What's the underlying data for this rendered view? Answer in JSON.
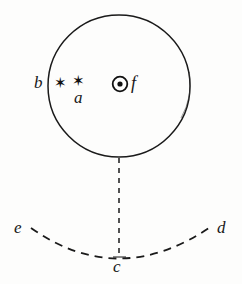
{
  "figure": {
    "background_color": "#fdfdfc",
    "ink_color": "#1a1a1a",
    "circle": {
      "name": "field-circle",
      "center_x": 119,
      "center_y": 86,
      "radius": 71,
      "stroke_width": 1.4,
      "style": "solid"
    },
    "vertical_line": {
      "name": "plumb-line",
      "x": 119,
      "y_start": 157,
      "y_end": 257,
      "style": "dashed"
    },
    "arc": {
      "name": "horizon-arc",
      "style": "dashed",
      "left_x": 30,
      "left_y": 228,
      "bottom_x": 119,
      "bottom_y": 257,
      "right_x": 212,
      "right_y": 226
    },
    "points": [
      {
        "id": "star-1",
        "glyph": "✶",
        "x": 60,
        "y": 84,
        "kind": "star-mark"
      },
      {
        "id": "star-2",
        "glyph": "✶",
        "x": 78,
        "y": 82,
        "kind": "star-mark"
      },
      {
        "id": "circled-dot",
        "glyph": "⊙",
        "x": 120,
        "y": 84,
        "kind": "circled-dot-mark"
      }
    ],
    "labels": [
      {
        "id": "b",
        "text": "b",
        "x": 40,
        "y": 83,
        "describes": "left edge of circle"
      },
      {
        "id": "a",
        "text": "a",
        "x": 80,
        "y": 98,
        "describes": "below second star mark"
      },
      {
        "id": "f",
        "text": "f",
        "x": 136,
        "y": 84,
        "describes": "right of circled dot"
      },
      {
        "id": "e",
        "text": "e",
        "x": 22,
        "y": 228,
        "describes": "left end of arc"
      },
      {
        "id": "c",
        "text": "c",
        "x": 120,
        "y": 268,
        "describes": "bottom of arc at plumb line"
      },
      {
        "id": "d",
        "text": "d",
        "x": 225,
        "y": 228,
        "describes": "right end of arc"
      }
    ]
  }
}
